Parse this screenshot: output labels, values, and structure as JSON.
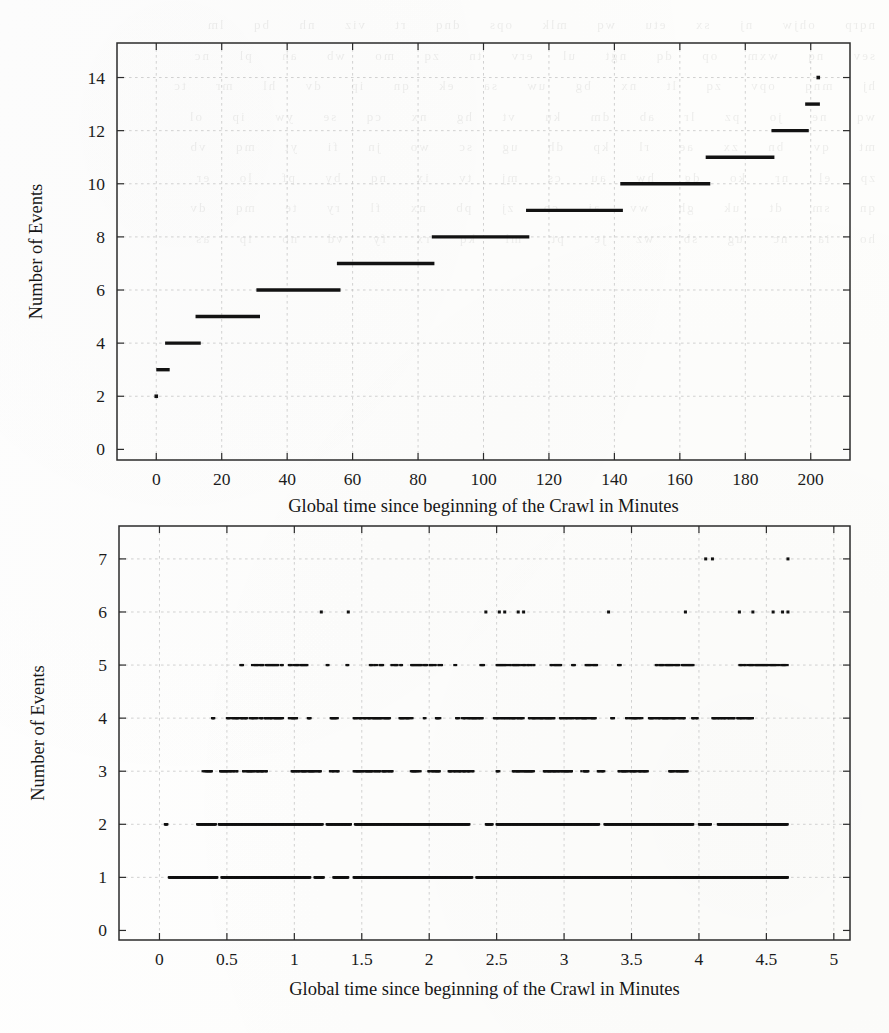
{
  "page": {
    "background_color": "#fefefe",
    "ink_color": "#121212",
    "grid_color": "#bfbfbf",
    "bleed_through_text": "nqrp  ohjw  nj  sx  etu  wq  mlk  ops  dnq  rt  viz  nh  bq  lm\nsev  nq  wxm  op  dq  ngt  ul  erv  tn  zq  mo  wb  ah  pl  nc\nhj  mnq  opv  zq  lt  nx  bg  uw  sa  ek  qn  ip  dv  hl  mr  tc\nwq  ne  jo  pz  lr  ab  dm  ku  vt  hg  nx  cq  se  yw  ip  ol\nmt  qv  bn  zx  ae  rl  kp  dh  ug  sc  wo  jn  fi  yt  mq  vb\nzp  el  nr  ko  dg  hw  au  cs  mj  tv  ix  nq  by  pf  lo  er\nqn  sm  dt  uk  gh  wv  ai  co  zj  pb  nx  fl  ry  te  mq  dv\nho  ia  nc  ug  sb  wz  je  pt  ml  kq  rx  fy  vd  no  ip  as"
  },
  "charts": [
    {
      "id": "chart-top",
      "chart_index": 0,
      "axis": {
        "xlabel": "Global time since beginning of the Crawl in Minutes",
        "ylabel": "Number of Events",
        "xticks": [
          0,
          20,
          40,
          60,
          80,
          100,
          120,
          140,
          160,
          180,
          200
        ],
        "xticklabels": [
          "0",
          "20",
          "40",
          "60",
          "80",
          "100",
          "120",
          "140",
          "160",
          "180",
          "200"
        ],
        "yticks": [
          0,
          2,
          4,
          6,
          8,
          10,
          12,
          14
        ],
        "yticklabels": [
          "0",
          "2",
          "4",
          "6",
          "8",
          "10",
          "12",
          "14"
        ],
        "xlim": [
          -12,
          212
        ],
        "ylim": [
          -0.4,
          15.3
        ],
        "grid": true
      }
    },
    {
      "id": "chart-bottom",
      "chart_index": 1,
      "axis": {
        "xlabel": "Global time since beginning of the Crawl in Minutes",
        "ylabel": "Number of Events",
        "xticks": [
          0,
          0.5,
          1,
          1.5,
          2,
          2.5,
          3,
          3.5,
          4,
          4.5,
          5
        ],
        "xticklabels": [
          "0",
          "0.5",
          "1",
          "1.5",
          "2",
          "2.5",
          "3",
          "3.5",
          "4",
          "4.5",
          "5"
        ],
        "yticks": [
          0,
          1,
          2,
          3,
          4,
          5,
          6,
          7
        ],
        "yticklabels": [
          "0",
          "1",
          "2",
          "3",
          "4",
          "5",
          "6",
          "7"
        ],
        "xlim": [
          -0.3,
          5.12
        ],
        "ylim": [
          -0.18,
          7.62
        ],
        "grid": true
      }
    }
  ],
  "chart_data": [
    {
      "type": "line",
      "subtype": "step",
      "title": "",
      "xlabel": "Global time since beginning of the Crawl in Minutes",
      "ylabel": "Number of Events",
      "xlim": [
        -12,
        212
      ],
      "ylim": [
        -0.4,
        15.3
      ],
      "grid": true,
      "legend": "none",
      "series": [
        {
          "name": "Cumulative events",
          "segments": [
            {
              "y": 2,
              "x0": 0.0,
              "x1": 0.3
            },
            {
              "y": 3,
              "x0": 0.0,
              "x1": 4.1
            },
            {
              "y": 4,
              "x0": 2.7,
              "x1": 13.6
            },
            {
              "y": 5,
              "x0": 12.0,
              "x1": 31.7
            },
            {
              "y": 6,
              "x0": 30.6,
              "x1": 56.3
            },
            {
              "y": 7,
              "x0": 55.2,
              "x1": 85.0
            },
            {
              "y": 8,
              "x0": 84.2,
              "x1": 114.0
            },
            {
              "y": 9,
              "x0": 113.0,
              "x1": 142.6
            },
            {
              "y": 10,
              "x0": 141.8,
              "x1": 169.3
            },
            {
              "y": 11,
              "x0": 167.9,
              "x1": 188.9
            },
            {
              "y": 12,
              "x0": 188.0,
              "x1": 199.4
            },
            {
              "y": 13,
              "x0": 198.3,
              "x1": 202.8
            },
            {
              "y": 14,
              "x0": 202.3,
              "x1": 203.0
            }
          ]
        }
      ]
    },
    {
      "type": "scatter",
      "title": "",
      "xlabel": "Global time since beginning of the Crawl in Minutes",
      "ylabel": "Number of Events",
      "xlim": [
        -0.3,
        5.12
      ],
      "ylim": [
        -0.18,
        7.62
      ],
      "grid": true,
      "legend": "none",
      "description": "Dense horizontal bands of points at integer event counts 1-7 spread across time 0 to 4.7 minutes",
      "bands": [
        {
          "y": 1,
          "density": "very-dense",
          "ranges": [
            [
              0.07,
              0.43
            ],
            [
              0.46,
              1.12
            ],
            [
              1.15,
              1.22
            ],
            [
              1.29,
              1.4
            ],
            [
              1.44,
              2.32
            ],
            [
              2.35,
              4.66
            ]
          ]
        },
        {
          "y": 2,
          "density": "very-dense",
          "ranges": [
            [
              0.04,
              0.06
            ],
            [
              0.28,
              0.42
            ],
            [
              0.44,
              1.21
            ],
            [
              1.24,
              1.42
            ],
            [
              1.45,
              2.3
            ],
            [
              2.42,
              2.47
            ],
            [
              2.5,
              3.26
            ],
            [
              3.3,
              3.96
            ],
            [
              4.0,
              4.09
            ],
            [
              4.14,
              4.66
            ]
          ]
        },
        {
          "y": 3,
          "density": "dense",
          "ranges": [
            [
              0.32,
              0.39
            ],
            [
              0.45,
              0.58
            ],
            [
              0.62,
              0.8
            ],
            [
              0.98,
              1.2
            ],
            [
              1.26,
              1.33
            ],
            [
              1.44,
              1.73
            ],
            [
              1.86,
              1.94
            ],
            [
              1.99,
              2.08
            ],
            [
              2.14,
              2.33
            ],
            [
              2.5,
              2.52
            ],
            [
              2.62,
              2.78
            ],
            [
              2.85,
              3.06
            ],
            [
              3.12,
              3.18
            ],
            [
              3.25,
              3.3
            ],
            [
              3.4,
              3.62
            ],
            [
              3.78,
              3.92
            ]
          ]
        },
        {
          "y": 4,
          "density": "dense",
          "ranges": [
            [
              0.39,
              0.41
            ],
            [
              0.5,
              0.92
            ],
            [
              0.96,
              1.02
            ],
            [
              1.1,
              1.12
            ],
            [
              1.27,
              1.33
            ],
            [
              1.44,
              1.72
            ],
            [
              1.78,
              1.88
            ],
            [
              1.96,
              1.98
            ],
            [
              2.05,
              2.09
            ],
            [
              2.2,
              2.4
            ],
            [
              2.48,
              2.7
            ],
            [
              2.74,
              2.93
            ],
            [
              2.97,
              3.24
            ],
            [
              3.35,
              3.38
            ],
            [
              3.46,
              3.58
            ],
            [
              3.63,
              3.9
            ],
            [
              3.95,
              4.0
            ],
            [
              4.1,
              4.4
            ]
          ]
        },
        {
          "y": 5,
          "density": "medium",
          "ranges": [
            [
              0.6,
              0.62
            ],
            [
              0.68,
              0.92
            ],
            [
              0.96,
              1.1
            ],
            [
              1.24,
              1.26
            ],
            [
              1.38,
              1.4
            ],
            [
              1.56,
              1.66
            ],
            [
              1.72,
              1.8
            ],
            [
              1.86,
              2.1
            ],
            [
              2.18,
              2.2
            ],
            [
              2.38,
              2.42
            ],
            [
              2.5,
              2.78
            ],
            [
              2.9,
              2.98
            ],
            [
              3.06,
              3.08
            ],
            [
              3.16,
              3.26
            ],
            [
              3.4,
              3.42
            ],
            [
              3.68,
              3.96
            ],
            [
              4.3,
              4.66
            ]
          ]
        },
        {
          "y": 6,
          "density": "sparse",
          "points": [
            1.2,
            1.4,
            2.42,
            2.52,
            2.56,
            2.66,
            2.7,
            3.33,
            3.9,
            4.3,
            4.4,
            4.55,
            4.62,
            4.66
          ]
        },
        {
          "y": 7,
          "density": "sparse",
          "points": [
            4.05,
            4.1,
            4.66
          ]
        }
      ]
    }
  ]
}
